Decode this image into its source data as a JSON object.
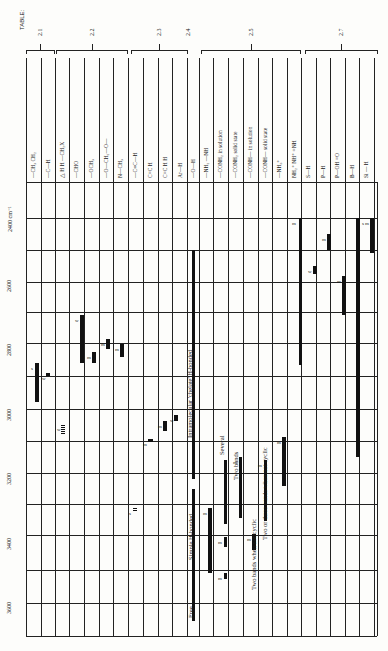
{
  "title": "TABLE:",
  "axis": {
    "unit_label": "2400 cm⁻¹",
    "ticks": [
      2600,
      2800,
      3000,
      3200,
      3400,
      3600
    ]
  },
  "groups": [
    {
      "label": "2.1",
      "x0": 26,
      "x1": 54
    },
    {
      "label": "2.2",
      "x0": 56,
      "x1": 127
    },
    {
      "label": "2.3",
      "x0": 131,
      "x1": 187
    },
    {
      "label": "2.4",
      "x0": 188,
      "x1": 188
    },
    {
      "label": "2.5",
      "x0": 201,
      "x1": 300
    },
    {
      "label": "2.7",
      "x0": 305,
      "x1": 377
    }
  ],
  "columns": [
    {
      "label": "—CH₃  CH₂",
      "x": 33
    },
    {
      "label": "—C—H",
      "x": 48
    },
    {
      "label": "△ H  H  —CH₂X",
      "x": 62
    },
    {
      "label": "—CHO",
      "x": 76
    },
    {
      "label": "—OCH₃",
      "x": 91
    },
    {
      "label": "—O—CH₂—O—",
      "x": 106
    },
    {
      "label": "N—CH₃",
      "x": 120
    },
    {
      "label": "—C≡C—H",
      "x": 135
    },
    {
      "label": "C=C H",
      "x": 150
    },
    {
      "label": "C=C H H",
      "x": 165
    },
    {
      "label": "Ar—H",
      "x": 180
    },
    {
      "label": "—O—H",
      "x": 193
    },
    {
      "label": "—NH₂  —NH",
      "x": 206
    },
    {
      "label": "—CONH₂ in solution",
      "x": 220
    },
    {
      "label": "—CONH₂ solid state",
      "x": 235
    },
    {
      "label": "—CONH— in solution",
      "x": 250
    },
    {
      "label": "—CONH— solid state",
      "x": 265
    },
    {
      "label": "—NH₃⁺",
      "x": 279
    },
    {
      "label": "NH₂⁺  NH⁺  =NH",
      "x": 294
    },
    {
      "label": "S—H",
      "x": 308
    },
    {
      "label": "P—H",
      "x": 323
    },
    {
      "label": "P—OH =O",
      "x": 337
    },
    {
      "label": "B—H",
      "x": 352
    },
    {
      "label": "Si — H",
      "x": 366
    }
  ],
  "annotations": [
    {
      "text": "Intramolecular 'chelate' H-bonded",
      "x": 186,
      "y": 438
    },
    {
      "text": "Several",
      "x": 218,
      "y": 455
    },
    {
      "text": "Two bands",
      "x": 232,
      "y": 480
    },
    {
      "text": "Two or three bands when not cyclic",
      "x": 261,
      "y": 540
    },
    {
      "text": "Simple H-bonded",
      "x": 187,
      "y": 560
    },
    {
      "text": "Two bands when not cyclic",
      "x": 250,
      "y": 590
    },
    {
      "text": "Free",
      "x": 187,
      "y": 618
    }
  ],
  "chart_data": {
    "type": "table",
    "xlabel": "Group",
    "ylabel": "Wavenumber (cm⁻¹)",
    "ylim": [
      2400,
      3700
    ],
    "ticks": [
      2400,
      2600,
      2800,
      3000,
      3200,
      3400,
      3600
    ],
    "grid": true,
    "ranges": [
      {
        "group": "—CH₃, CH₂",
        "from": 2850,
        "to": 2970,
        "intensity": "s"
      },
      {
        "group": "—C—H",
        "from": 2880,
        "to": 2900,
        "intensity": "w"
      },
      {
        "group": "Cyclopropane C—H / —CH₂X",
        "from": 3040,
        "to": 3060,
        "intensity": "w"
      },
      {
        "group": "—CHO",
        "from": 2700,
        "to": 2850,
        "intensity": "w"
      },
      {
        "group": "—OCH₃",
        "from": 2815,
        "to": 2835,
        "intensity": "m"
      },
      {
        "group": "—O—CH₂—O—",
        "from": 2770,
        "to": 2790,
        "intensity": "m"
      },
      {
        "group": "N—CH₃",
        "from": 2780,
        "to": 2820,
        "intensity": "m"
      },
      {
        "group": "—C≡C—H",
        "from": 3300,
        "to": 3310,
        "intensity": "s"
      },
      {
        "group": "C=C—H",
        "from": 3075,
        "to": 3095,
        "intensity": "m"
      },
      {
        "group": "C=C—H (2)",
        "from": 3000,
        "to": 3040,
        "intensity": "m"
      },
      {
        "group": "Ar—H",
        "from": 3010,
        "to": 3040,
        "intensity": "w"
      },
      {
        "group": "—O—H free",
        "from": 3590,
        "to": 3650,
        "intensity": "v"
      },
      {
        "group": "—O—H simple H-bonded",
        "from": 3200,
        "to": 3550,
        "intensity": "s"
      },
      {
        "group": "—O—H intramolecular chelate",
        "from": 2500,
        "to": 3200,
        "intensity": "w"
      },
      {
        "group": "—NH₂, —NH",
        "from": 3300,
        "to": 3500,
        "intensity": "m"
      },
      {
        "group": "—CONH₂ in solution",
        "from": 3400,
        "to": 3420,
        "intensity": "m"
      },
      {
        "group": "—CONH₂ in solution (2)",
        "from": 3500,
        "to": 3520,
        "intensity": "m"
      },
      {
        "group": "—CONH₂ solid state",
        "from": 3150,
        "to": 3350,
        "intensity": "m"
      },
      {
        "group": "—CONH— in solution",
        "from": 3400,
        "to": 3440,
        "intensity": "m"
      },
      {
        "group": "—CONH— in solution (2)",
        "from": 3060,
        "to": 3100,
        "intensity": "w"
      },
      {
        "group": "—CONH— solid state",
        "from": 3150,
        "to": 3320,
        "intensity": "m"
      },
      {
        "group": "—NH₃⁺",
        "from": 3100,
        "to": 3300,
        "intensity": "m"
      },
      {
        "group": "NH₂⁺ / NH⁺ / =NH",
        "from": 3050,
        "to": 3300,
        "intensity": "m"
      },
      {
        "group": "—NH₃⁺ (2)",
        "from": 2400,
        "to": 2800,
        "intensity": "m"
      },
      {
        "group": "S—H",
        "from": 2550,
        "to": 2600,
        "intensity": "w"
      },
      {
        "group": "P—H",
        "from": 2440,
        "to": 2350,
        "intensity": "m"
      },
      {
        "group": "P—OH",
        "from": 2560,
        "to": 2700,
        "intensity": "m"
      },
      {
        "group": "B—H",
        "from": 2400,
        "to": 3150,
        "intensity": "s"
      },
      {
        "group": "Si—H",
        "from": 2360,
        "to": 2230,
        "intensity": "m"
      }
    ]
  }
}
